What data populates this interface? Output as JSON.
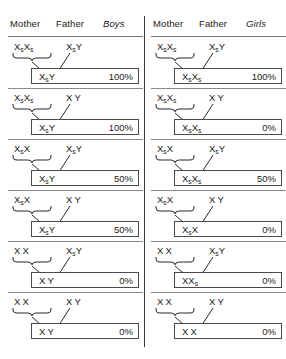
{
  "panels": [
    {
      "name": "boys",
      "headers": {
        "mother": "Mother",
        "father": "Father",
        "sex": "Boys"
      },
      "rows": [
        {
          "mother": "XsXs",
          "father": "XsY",
          "result": "XsY",
          "percent": "100%"
        },
        {
          "mother": "XsXs",
          "father": "XY",
          "result": "XsY",
          "percent": "100%"
        },
        {
          "mother": "XsX",
          "father": "XsY",
          "result": "XsY",
          "percent": "50%"
        },
        {
          "mother": "XsX",
          "father": "XY",
          "result": "XsY",
          "percent": "50%"
        },
        {
          "mother": "XX",
          "father": "XsY",
          "result": "XY",
          "percent": "0%"
        },
        {
          "mother": "XX",
          "father": "XY",
          "result": "XY",
          "percent": "0%"
        }
      ]
    },
    {
      "name": "girls",
      "headers": {
        "mother": "Mother",
        "father": "Father",
        "sex": "Girls"
      },
      "rows": [
        {
          "mother": "XsXs",
          "father": "XsY",
          "result": "XsXs",
          "percent": "100%"
        },
        {
          "mother": "XsXs",
          "father": "XY",
          "result": "XsXs",
          "percent": "0%"
        },
        {
          "mother": "XsX",
          "father": "XsY",
          "result": "XsXs",
          "percent": "50%"
        },
        {
          "mother": "XsX",
          "father": "XY",
          "result": "XsX",
          "percent": "0%"
        },
        {
          "mother": "XX",
          "father": "XsY",
          "result": "XXs",
          "percent": "0%"
        },
        {
          "mother": "XX",
          "father": "XY",
          "result": "XX",
          "percent": "0%"
        }
      ]
    }
  ],
  "colors": {
    "ink": "#1a1a1a",
    "rule": "#8a8a8a",
    "box_border": "#4a4a4a",
    "background": "#ffffff"
  }
}
